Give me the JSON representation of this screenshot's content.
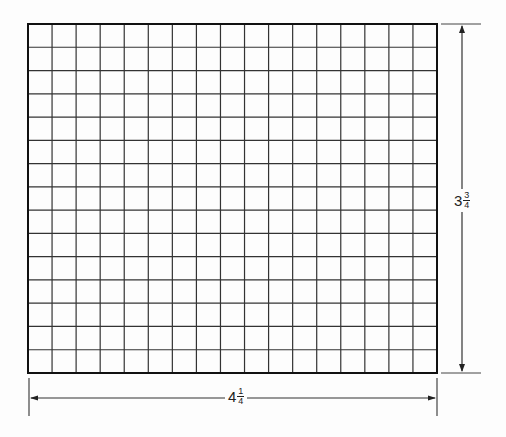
{
  "diagram": {
    "type": "grid-with-dimensions",
    "grid": {
      "columns": 17,
      "rows": 15,
      "left": 28,
      "top": 24,
      "right": 437,
      "bottom": 373,
      "line_color": "#333333",
      "border_color": "#111111"
    },
    "dimensions": {
      "width": {
        "whole": "4",
        "numerator": "1",
        "denominator": "4",
        "text": "4 1/4"
      },
      "height": {
        "whole": "3",
        "numerator": "3",
        "denominator": "4",
        "text": "3 3/4"
      }
    }
  }
}
